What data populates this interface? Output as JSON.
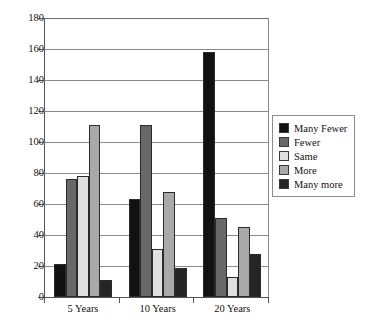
{
  "chart_data": {
    "type": "bar",
    "title": "",
    "subtitle": "",
    "xlabel": "",
    "ylabel": "",
    "categories": [
      "5 Years",
      "10 Years",
      "20 Years"
    ],
    "series": [
      {
        "name": "Many Fewer",
        "color": "#111111",
        "values": [
          21,
          63,
          158
        ]
      },
      {
        "name": "Fewer",
        "color": "#686868",
        "values": [
          76,
          111,
          51
        ]
      },
      {
        "name": "Same",
        "color": "#e0e0e0",
        "values": [
          78,
          31,
          13
        ]
      },
      {
        "name": "More",
        "color": "#a9a9a9",
        "values": [
          111,
          68,
          45
        ]
      },
      {
        "name": "Many more",
        "color": "#252525",
        "values": [
          11,
          19,
          28
        ]
      }
    ],
    "ylim": [
      0,
      180
    ],
    "ytick_step": 20,
    "yticks": [
      0,
      20,
      40,
      60,
      80,
      100,
      120,
      140,
      160,
      180
    ],
    "ytick_labels": [
      "0",
      "20",
      "40",
      "60",
      "80",
      "100",
      "120",
      "140",
      "160",
      "180"
    ],
    "grid": true,
    "grid_axis": "y",
    "legend_position": "right",
    "legend_entries": [
      "Many Fewer",
      "Fewer",
      "Same",
      "More",
      "Many more"
    ],
    "bar_border_color": "#2b2b2b",
    "grid_color": "#8a8a8a",
    "axis_color": "#555555",
    "background_color": "#ffffff"
  }
}
